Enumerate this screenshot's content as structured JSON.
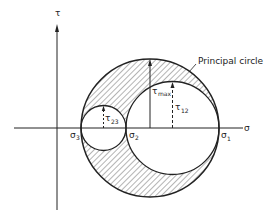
{
  "diagram": {
    "axes": {
      "x_label": "σ",
      "y_label": "τ"
    },
    "annotations": {
      "principal_circle": "Principal circle",
      "tau_max": "τ",
      "tau_max_sub": "max",
      "tau_12": "τ",
      "tau_12_sub": "12",
      "tau_23": "τ",
      "tau_23_sub": "23"
    },
    "points": {
      "sigma_3": "σ",
      "sigma_3_sub": "3",
      "sigma_2": "σ",
      "sigma_2_sub": "2",
      "sigma_1": "σ",
      "sigma_1_sub": "1"
    },
    "colors": {
      "line": "#222222",
      "hatch": "#444444",
      "background": "#ffffff"
    }
  }
}
